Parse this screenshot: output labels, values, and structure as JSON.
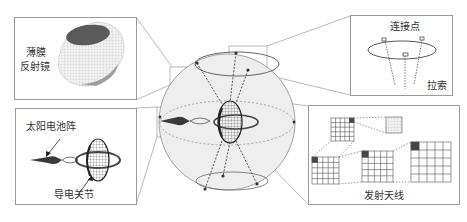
{
  "diagram": {
    "type": "space-solar-power-station-schematic",
    "center": {
      "name": "spherical-reflector-structure",
      "description": "Transparent sphere with tether cables, central transmitting antenna disk, solar array and ring"
    },
    "callouts": {
      "top_left": {
        "lines": [
          "薄膜",
          "反射镜"
        ]
      },
      "top_right": {
        "top_label": "连接点",
        "bottom_label": "拉索"
      },
      "bottom_left": {
        "top_label": "太阳电池阵",
        "bottom_label": "导电关节"
      },
      "bottom_right": {
        "bottom_label": "发射天线"
      }
    },
    "colors": {
      "line": "#8a8a8a",
      "panel_border": "#9a9a9a",
      "sphere_fill": "#ececec",
      "dark": "#444444",
      "text": "#333333"
    }
  }
}
